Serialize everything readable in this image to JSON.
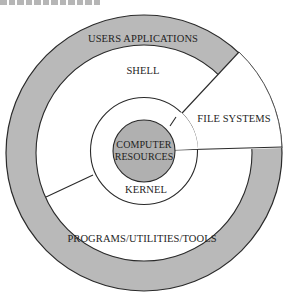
{
  "caption": {
    "partial_text_visible": true,
    "note": "cut-off caption text at top edge"
  },
  "diagram": {
    "type": "concentric-layers",
    "colors": {
      "ring_fill": "#b9b9b9",
      "core_fill": "#b0b0b0",
      "background": "#ffffff",
      "stroke": "#2a2a2a"
    },
    "layers": [
      {
        "id": "users-applications",
        "label": "USERS APPLICATIONS",
        "fill": "gray"
      },
      {
        "id": "shell",
        "label": "SHELL",
        "fill": "white"
      },
      {
        "id": "file-systems",
        "label": "FILE SYSTEMS",
        "fill": "white",
        "shape": "wedge"
      },
      {
        "id": "programs-utilities-tools",
        "label": "PROGRAMS/UTILITIES/TOOLS",
        "fill": "white"
      },
      {
        "id": "kernel",
        "label": "KERNEL",
        "fill": "white"
      },
      {
        "id": "computer-resources",
        "label_line1": "COMPUTER",
        "label_line2": "RESOURCES",
        "fill": "gray"
      }
    ]
  }
}
